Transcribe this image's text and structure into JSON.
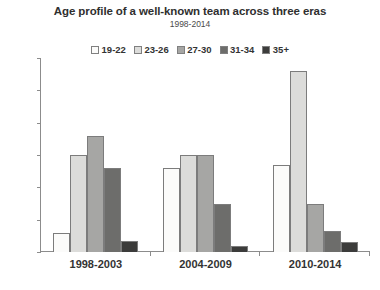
{
  "chart_data": {
    "type": "bar",
    "title": "Age profile of a well-known team across three eras",
    "subtitle": "1998-2014",
    "xlabel": "",
    "ylabel": "Number of players",
    "categories": [
      "1998-2003",
      "2004-2009",
      "2010-2014"
    ],
    "series": [
      {
        "name": "19-22",
        "color": "#fbfbfa",
        "values": [
          0.6,
          2.6,
          2.7
        ]
      },
      {
        "name": "23-26",
        "color": "#dcdcda",
        "values": [
          3.0,
          3.0,
          5.6
        ]
      },
      {
        "name": "27-30",
        "color": "#a6a6a4",
        "values": [
          3.6,
          3.0,
          1.5
        ]
      },
      {
        "name": "31-34",
        "color": "#6d6d6b",
        "values": [
          2.6,
          1.5,
          0.65
        ]
      },
      {
        "name": "35+",
        "color": "#3c3c3b",
        "values": [
          0.35,
          0.2,
          0.3
        ]
      }
    ],
    "ylim": [
      0,
      6
    ],
    "y_ticks": [
      0,
      1,
      2,
      3,
      4,
      5,
      6
    ],
    "y_tick_labels_shown": false,
    "grid": false,
    "legend_position": "top"
  }
}
